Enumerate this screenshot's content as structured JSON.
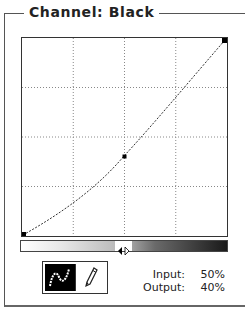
{
  "panel": {
    "title": "Channel: Black"
  },
  "curve": {
    "grid_divisions": 4,
    "points": [
      {
        "input": 0,
        "output": 0
      },
      {
        "input": 50,
        "output": 40
      },
      {
        "input": 100,
        "output": 100
      }
    ],
    "selected_point_index": 1
  },
  "tools": {
    "curve_tool": {
      "name": "curve",
      "active": true
    },
    "pencil_tool": {
      "name": "pencil",
      "active": false
    }
  },
  "readout": {
    "input_label": "Input:",
    "input_value": "50%",
    "output_label": "Output:",
    "output_value": "40%"
  },
  "colors": {
    "line": "#333333",
    "grid": "#888888",
    "active_tool_bg": "#000000"
  }
}
